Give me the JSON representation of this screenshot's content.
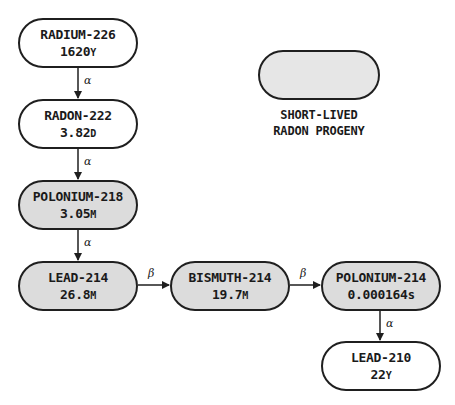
{
  "diagram": {
    "type": "decay-chain",
    "nodes": [
      {
        "id": "ra226",
        "name": "RADIUM-226",
        "half_life_value": "1620",
        "half_life_unit": "Y",
        "shaded": false
      },
      {
        "id": "rn222",
        "name": "RADON-222",
        "half_life_value": "3.82",
        "half_life_unit": "D",
        "shaded": false
      },
      {
        "id": "po218",
        "name": "POLONIUM-218",
        "half_life_value": "3.05",
        "half_life_unit": "M",
        "shaded": true
      },
      {
        "id": "pb214",
        "name": "LEAD-214",
        "half_life_value": "26.8",
        "half_life_unit": "M",
        "shaded": true
      },
      {
        "id": "bi214",
        "name": "BISMUTH-214",
        "half_life_value": "19.7",
        "half_life_unit": "M",
        "shaded": true
      },
      {
        "id": "po214",
        "name": "POLONIUM-214",
        "half_life_value": "0.000164",
        "half_life_unit": "s",
        "shaded": true
      },
      {
        "id": "pb210",
        "name": "LEAD-210",
        "half_life_value": "22",
        "half_life_unit": "Y",
        "shaded": false
      }
    ],
    "edges": [
      {
        "from": "ra226",
        "to": "rn222",
        "label": "α"
      },
      {
        "from": "rn222",
        "to": "po218",
        "label": "α"
      },
      {
        "from": "po218",
        "to": "pb214",
        "label": "α"
      },
      {
        "from": "pb214",
        "to": "bi214",
        "label": "β"
      },
      {
        "from": "bi214",
        "to": "po214",
        "label": "β"
      },
      {
        "from": "po214",
        "to": "pb210",
        "label": "α"
      }
    ],
    "legend": {
      "line1": "SHORT-LIVED",
      "line2": "RADON PROGENY",
      "swatch_color": "#e6e6e6"
    },
    "colors": {
      "shaded_fill": "#dcdcdc",
      "unshaded_fill": "#ffffff",
      "stroke": "#1f1f1f"
    }
  }
}
